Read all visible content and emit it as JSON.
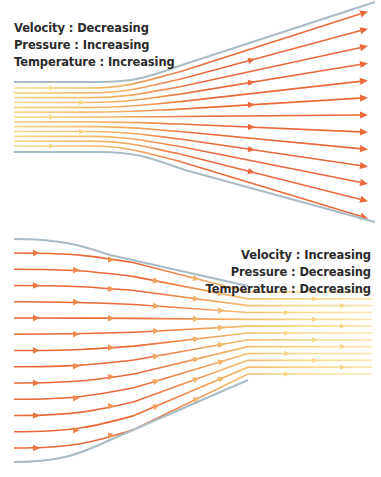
{
  "diagram": {
    "colors": {
      "wall": "#a9bcc6",
      "flow_slow": "#f7d88a",
      "flow_mid": "#f2b266",
      "flow_fast": "#e8693a"
    }
  },
  "diffuser": {
    "labels": [
      {
        "property": "Velocity",
        "separator": " : ",
        "state": "Decreasing",
        "text": "Velocity : Decreasing"
      },
      {
        "property": "Pressure",
        "separator": " : ",
        "state": "Increasing",
        "text": "Pressure : Increasing"
      },
      {
        "property": "Temperature",
        "separator": " : ",
        "state": "Increasing",
        "text": "Temperature : Increasing"
      }
    ],
    "geometry": {
      "inlet_x": 14,
      "throat_end_x": 110,
      "outlet_x": 375,
      "top_wall_inlet_y": 82,
      "top_wall_outlet_y": 2,
      "bottom_wall_inlet_y": 152,
      "bottom_wall_outlet_y": 222,
      "streamline_count": 13
    },
    "flow_direction": "left-to-right, lines diverging, color fades from pale yellow (inlet) to orange-red (outlet)"
  },
  "nozzle": {
    "labels": [
      {
        "property": "Velocity",
        "separator": " : ",
        "state": "Increasing",
        "text": "Velocity : Increasing"
      },
      {
        "property": "Pressure",
        "separator": " : ",
        "state": "Decreasing",
        "text": "Pressure : Decreasing"
      },
      {
        "property": "Temperature",
        "separator": " : ",
        "state": "Decreasing",
        "text": "Temperature : Decreasing"
      }
    ],
    "geometry": {
      "inlet_x": 14,
      "throat_start_x": 248,
      "outlet_x": 375,
      "top_wall_inlet_y": 9,
      "top_wall_throat_y": 56,
      "bottom_wall_inlet_y": 232,
      "bottom_wall_throat_y": 150,
      "streamline_count": 13
    },
    "flow_direction": "left-to-right, lines converging, color fades from orange-red (inlet) to pale yellow (outlet)"
  }
}
